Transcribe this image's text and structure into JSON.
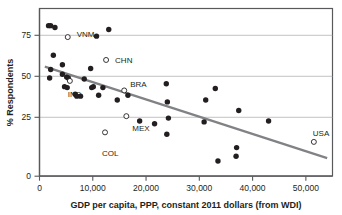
{
  "chart_data": {
    "type": "scatter",
    "title": "",
    "xlabel": "GDP per capita, PPP, constant 2011 dollars (from WDI)",
    "ylabel": "% Respondents",
    "xlim": [
      0,
      55000
    ],
    "ylim": [
      0,
      88
    ],
    "xticks": [
      0,
      10000,
      20000,
      30000,
      40000,
      50000
    ],
    "xticklabels": [
      "0",
      "10,000",
      "20,000",
      "30,000",
      "40,000",
      "50,000"
    ],
    "yticks": [
      0,
      25,
      50,
      75
    ],
    "yticklabels": [
      "0",
      "25",
      "50",
      "75"
    ],
    "grid": "horizontal",
    "legend": "none",
    "point_color": "#231f20",
    "highlight_marker": "open-circle",
    "trend_color": "#808285",
    "series": [
      {
        "name": "Countries (unlabeled)",
        "marker": "filled-circle",
        "points": [
          {
            "x": 1700,
            "y": 79
          },
          {
            "x": 2100,
            "y": 79
          },
          {
            "x": 2900,
            "y": 78
          },
          {
            "x": 2100,
            "y": 56
          },
          {
            "x": 1900,
            "y": 51.5
          },
          {
            "x": 2600,
            "y": 63.5
          },
          {
            "x": 4300,
            "y": 58.5
          },
          {
            "x": 4300,
            "y": 53.5
          },
          {
            "x": 5100,
            "y": 52
          },
          {
            "x": 5400,
            "y": 51.5
          },
          {
            "x": 4700,
            "y": 47
          },
          {
            "x": 5200,
            "y": 46.5
          },
          {
            "x": 6700,
            "y": 43
          },
          {
            "x": 7000,
            "y": 42
          },
          {
            "x": 7700,
            "y": 42
          },
          {
            "x": 8400,
            "y": 51
          },
          {
            "x": 9600,
            "y": 56.5
          },
          {
            "x": 9800,
            "y": 46.5
          },
          {
            "x": 10100,
            "y": 47
          },
          {
            "x": 10700,
            "y": 73.5
          },
          {
            "x": 11100,
            "y": 42.5
          },
          {
            "x": 11900,
            "y": 46.5
          },
          {
            "x": 13000,
            "y": 77
          },
          {
            "x": 14600,
            "y": 40
          },
          {
            "x": 16600,
            "y": 42.5
          },
          {
            "x": 18800,
            "y": 29
          },
          {
            "x": 21600,
            "y": 27.5
          },
          {
            "x": 23800,
            "y": 48.5
          },
          {
            "x": 24000,
            "y": 39
          },
          {
            "x": 24200,
            "y": 30.5
          },
          {
            "x": 23900,
            "y": 22
          },
          {
            "x": 30900,
            "y": 28.5
          },
          {
            "x": 31200,
            "y": 40
          },
          {
            "x": 33000,
            "y": 46
          },
          {
            "x": 33500,
            "y": 8
          },
          {
            "x": 37000,
            "y": 15
          },
          {
            "x": 36900,
            "y": 10.5
          },
          {
            "x": 37400,
            "y": 34.5
          },
          {
            "x": 43000,
            "y": 29
          }
        ]
      },
      {
        "name": "Labeled countries",
        "marker": "open-circle",
        "points": [
          {
            "x": 5300,
            "y": 73,
            "label": "VNM",
            "label_dx": 9,
            "label_dy": -3
          },
          {
            "x": 12500,
            "y": 61,
            "label": "CHN",
            "label_dx": 9,
            "label_dy": 0
          },
          {
            "x": 5700,
            "y": 50,
            "label": "IND",
            "label_dx": -2,
            "label_dy": 13
          },
          {
            "x": 15900,
            "y": 45,
            "label": "BRA",
            "label_dx": 6,
            "label_dy": -6
          },
          {
            "x": 16300,
            "y": 31.5,
            "label": "MEX",
            "label_dx": 6,
            "label_dy": 12
          },
          {
            "x": 12300,
            "y": 23,
            "label": "COL",
            "label_dx": -3,
            "label_dy": 21
          },
          {
            "x": 51500,
            "y": 18,
            "label": "USA",
            "label_dx": -1,
            "label_dy": -9
          }
        ]
      }
    ],
    "trendline": {
      "type": "linear",
      "x_start": 1000,
      "y_start": 57.5,
      "x_end": 54000,
      "y_end": 9.5
    }
  }
}
